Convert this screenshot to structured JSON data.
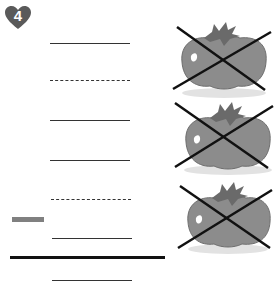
{
  "worksheet": {
    "problem_number": "4",
    "badge_shape": "heart",
    "colors": {
      "badge": "#5a5a5a",
      "ink": "#222222",
      "tomato_body": "#8a8a8a",
      "tomato_leaf": "#6a6a6a",
      "gray_bar": "#808080"
    }
  },
  "answer_lines": [
    {
      "type": "solid",
      "y": 44,
      "x1": 50,
      "x2": 130
    },
    {
      "type": "dashed",
      "y": 81,
      "x1": 50,
      "x2": 130
    },
    {
      "type": "solid",
      "y": 121,
      "x1": 50,
      "x2": 130
    },
    {
      "type": "solid",
      "y": 161,
      "x1": 50,
      "x2": 130
    },
    {
      "type": "dashed",
      "y": 200,
      "x1": 51,
      "x2": 131
    },
    {
      "type": "solid",
      "y": 239,
      "x1": 52,
      "x2": 132
    },
    {
      "type": "thick",
      "y": 257,
      "x1": 10,
      "x2": 165
    },
    {
      "type": "solid",
      "y": 281,
      "x1": 52,
      "x2": 132
    }
  ],
  "minus_sign": {
    "x": 12,
    "y": 217,
    "width": 32
  },
  "tomatoes": [
    {
      "label": "tomato-1",
      "crossed_out": true,
      "top": 22
    },
    {
      "label": "tomato-2",
      "crossed_out": true,
      "top": 100
    },
    {
      "label": "tomato-3",
      "crossed_out": true,
      "top": 182
    }
  ]
}
